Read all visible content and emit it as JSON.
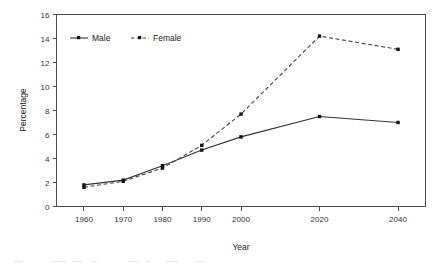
{
  "chart_data": {
    "type": "line",
    "title": "",
    "subtitle": "",
    "xlabel": "Year",
    "ylabel": "Percentage",
    "x": [
      1960,
      1970,
      1980,
      1990,
      2000,
      2020,
      2040
    ],
    "xtick_labels": [
      "1960",
      "1970",
      "1980",
      "1990",
      "2000",
      "2020",
      "2040"
    ],
    "ytick_labels": [
      "0",
      "2",
      "4",
      "6",
      "8",
      "10",
      "12",
      "14",
      "16"
    ],
    "ytick_values": [
      0,
      2,
      4,
      6,
      8,
      10,
      12,
      14,
      16
    ],
    "xlim": [
      1953,
      2047
    ],
    "ylim": [
      0,
      16
    ],
    "grid": false,
    "legend_position": "top-left inside plot area",
    "series": [
      {
        "name": "Male",
        "style": "solid",
        "marker": "square",
        "color": "#333333",
        "values": [
          1.8,
          2.2,
          3.4,
          4.7,
          5.8,
          7.5,
          7.0
        ]
      },
      {
        "name": "Female",
        "style": "dashed",
        "marker": "square",
        "color": "#444444",
        "values": [
          1.6,
          2.1,
          3.2,
          5.1,
          7.7,
          14.2,
          13.1
        ]
      }
    ],
    "annotations": []
  },
  "legend": {
    "items": [
      {
        "label": "Male"
      },
      {
        "label": "Female"
      }
    ]
  },
  "axes": {
    "y_title": "Percentage",
    "x_title": "Year"
  }
}
